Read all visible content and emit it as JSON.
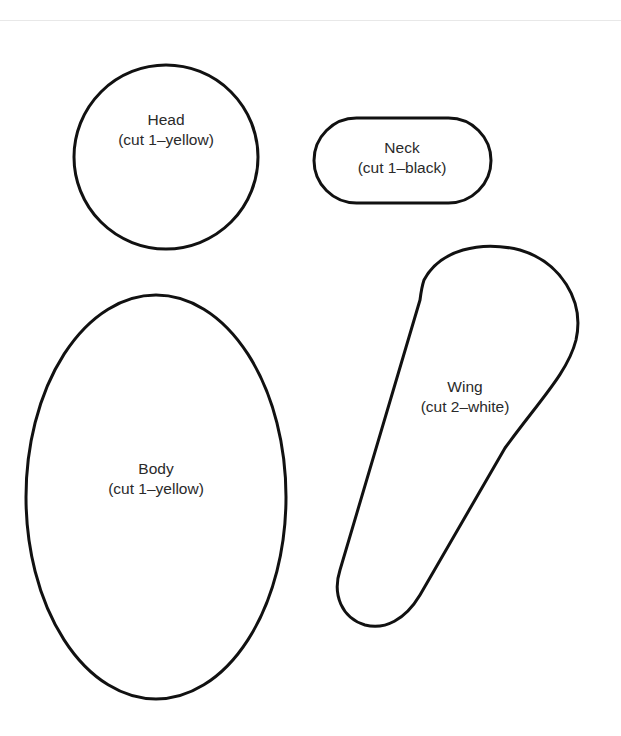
{
  "stroke_color": "#111111",
  "pieces": {
    "head": {
      "name": "Head",
      "instruction": "(cut 1–yellow)",
      "shape": "circle"
    },
    "neck": {
      "name": "Neck",
      "instruction": "(cut 1–black)",
      "shape": "rounded-rectangle"
    },
    "wing": {
      "name": "Wing",
      "instruction": "(cut 2–white)",
      "shape": "teardrop"
    },
    "body": {
      "name": "Body",
      "instruction": "(cut 1–yellow)",
      "shape": "ellipse"
    }
  }
}
